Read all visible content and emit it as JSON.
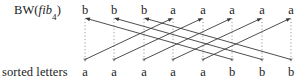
{
  "figure": {
    "title_prefix": "BW(",
    "title_italic": "fib",
    "title_subscript": "4",
    "title_suffix": ")",
    "top_row_label": "BW(fib4)",
    "bottom_row_label": "sorted letters",
    "width": 303,
    "height": 82,
    "background_color": "#ffffff",
    "text_color": "#1c1c1c",
    "dotted_line_color": "#9a9a9a",
    "diagonal_line_color": "#3a3a3a"
  },
  "chart_data": {
    "type": "diagram",
    "columns": 8,
    "top_row": {
      "name": "BW(fib4)",
      "letters": [
        "b",
        "b",
        "b",
        "a",
        "a",
        "a",
        "a",
        "a"
      ]
    },
    "bottom_row": {
      "name": "sorted letters",
      "letters": [
        "a",
        "a",
        "a",
        "a",
        "a",
        "b",
        "b",
        "b"
      ]
    },
    "column_x": [
      85,
      114,
      144,
      173,
      203,
      232,
      262,
      291
    ],
    "top_y": 14,
    "bottom_y": 66,
    "dotted_edges": [
      {
        "from_top": 1,
        "to_bottom": 1
      },
      {
        "from_top": 2,
        "to_bottom": 2
      },
      {
        "from_top": 3,
        "to_bottom": 3
      },
      {
        "from_top": 4,
        "to_bottom": 4
      },
      {
        "from_top": 5,
        "to_bottom": 5
      },
      {
        "from_top": 6,
        "to_bottom": 6
      },
      {
        "from_top": 7,
        "to_bottom": 7
      },
      {
        "from_top": 8,
        "to_bottom": 8
      }
    ],
    "diagonal_edges": [
      {
        "from_bottom": 1,
        "to_top": 4
      },
      {
        "from_bottom": 2,
        "to_top": 5
      },
      {
        "from_bottom": 3,
        "to_top": 6
      },
      {
        "from_bottom": 4,
        "to_top": 7
      },
      {
        "from_bottom": 5,
        "to_top": 8
      },
      {
        "from_bottom": 6,
        "to_top": 1
      },
      {
        "from_bottom": 7,
        "to_top": 2
      },
      {
        "from_bottom": 8,
        "to_top": 3
      }
    ],
    "legend": [],
    "grid": false
  }
}
